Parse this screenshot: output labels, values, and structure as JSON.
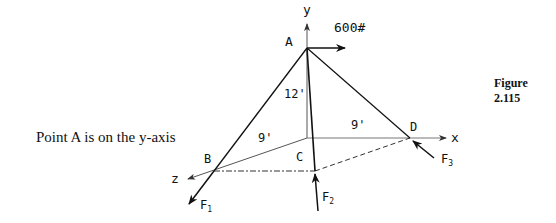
{
  "caption": "Point A is on the y-axis",
  "figure_label": "Figure 2.115",
  "diagram": {
    "axes": {
      "x": "x",
      "y": "y",
      "z": "z"
    },
    "points": {
      "A": "A",
      "B": "B",
      "C": "C",
      "D": "D"
    },
    "dimensions": {
      "height": "12'",
      "left": "9'",
      "right": "9'"
    },
    "load": "600#",
    "forces": {
      "F1": "F",
      "F1_sub": "1",
      "F2": "F",
      "F2_sub": "2",
      "F3": "F",
      "F3_sub": "3"
    }
  }
}
